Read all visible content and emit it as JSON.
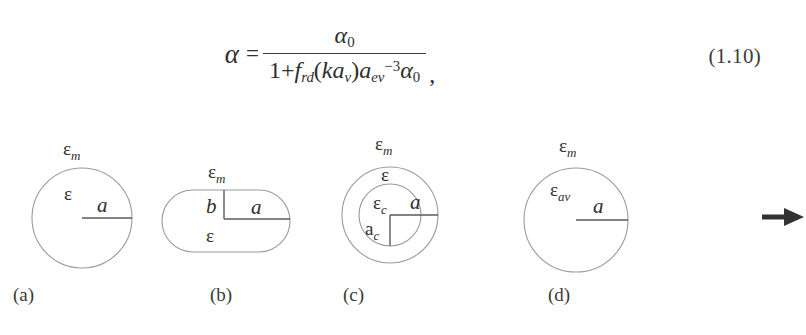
{
  "equation": {
    "label": "alpha-polarizability-equation",
    "number": "(1.10)",
    "lhs": "α",
    "relation": "=",
    "numerator": "α₀",
    "numerator_base": "α",
    "numerator_sub": "0",
    "denominator_text": "1+ f_rd(ka_v)a_ev^-3 α_0",
    "den_one_plus": "1+",
    "den_f": "f",
    "den_f_sub": "rd",
    "den_open": "(",
    "den_k": "k",
    "den_a1": "a",
    "den_a1_sub": "v",
    "den_close": ")",
    "den_a2": "a",
    "den_a2_sub": "ev",
    "den_a2_sup": "−3",
    "den_alpha": "α",
    "den_alpha_sub": "0",
    "trailing_comma": ","
  },
  "figure": {
    "name": "inclusion-shape-diagram",
    "arrow": "→",
    "panels": [
      {
        "id": "a",
        "caption": "(a)",
        "shape": "circle",
        "outer_medium_label": "ε",
        "outer_medium_sub": "m",
        "inner_label": "ε",
        "inner_sub": "",
        "radius_label": "a",
        "second_radius_label": ""
      },
      {
        "id": "b",
        "caption": "(b)",
        "shape": "stadium",
        "outer_medium_label": "ε",
        "outer_medium_sub": "m",
        "inner_label": "ε",
        "inner_sub": "",
        "radius_label": "a",
        "second_radius_label": "b"
      },
      {
        "id": "c",
        "caption": "(c)",
        "shape": "concentric-circles",
        "outer_medium_label": "ε",
        "outer_medium_sub": "m",
        "inner_label": "ε",
        "inner_sub": "",
        "core_label": "ε",
        "core_sub": "c",
        "radius_label": "a",
        "second_radius_label": "a",
        "second_radius_sub": "c"
      },
      {
        "id": "d",
        "caption": "(d)",
        "shape": "circle",
        "outer_medium_label": "ε",
        "outer_medium_sub": "m",
        "inner_label": "ε",
        "inner_sub": "av",
        "radius_label": "a",
        "second_radius_label": ""
      }
    ]
  },
  "colors": {
    "background": "#ffffff",
    "text": "#2f2f2f",
    "shape_stroke": "#9a9a9a",
    "rule_line": "#5a5a5a",
    "arrow": "#333333"
  }
}
